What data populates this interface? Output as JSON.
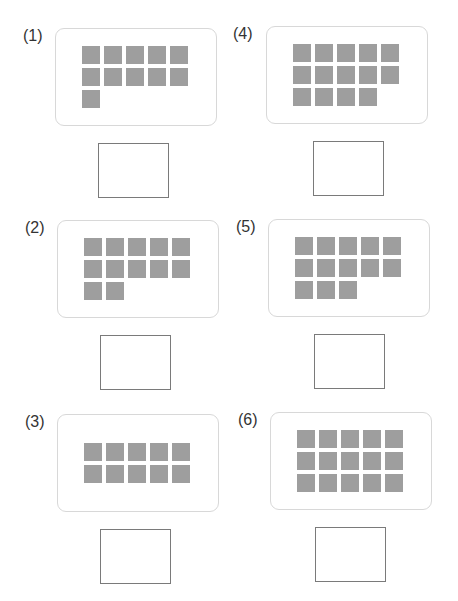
{
  "worksheet": {
    "instruction_text_clipped": "",
    "problems": [
      {
        "label": "(1)",
        "count": 11,
        "answer": ""
      },
      {
        "label": "(2)",
        "count": 12,
        "answer": ""
      },
      {
        "label": "(3)",
        "count": 10,
        "answer": ""
      },
      {
        "label": "(4)",
        "count": 14,
        "answer": ""
      },
      {
        "label": "(5)",
        "count": 13,
        "answer": ""
      },
      {
        "label": "(6)",
        "count": 15,
        "answer": ""
      }
    ],
    "squares_per_row": 5,
    "colors": {
      "square": "#9e9e9e",
      "card_border": "#d8d8d8",
      "answer_border": "#7a7a7a",
      "label": "#333333"
    }
  }
}
